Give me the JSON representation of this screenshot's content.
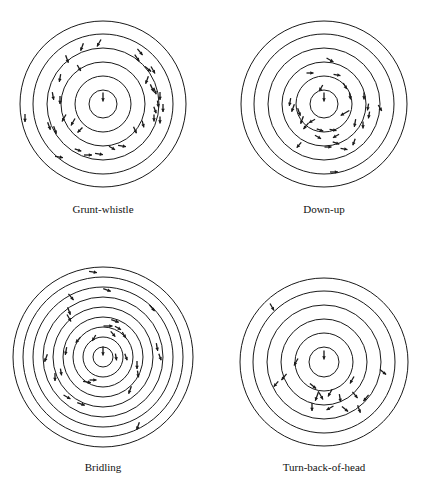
{
  "figure": {
    "panels": [
      {
        "id": "grunt-whistle",
        "caption": "Grunt-whistle",
        "center": [
          103,
          104
        ],
        "ring_radii": [
          14,
          28,
          42,
          56,
          70,
          83
        ],
        "caption_pos": [
          103,
          211
        ],
        "arrows": [
          [
            103,
            97,
            0,
            9
          ],
          [
            99,
            43,
            -30,
            8
          ],
          [
            82,
            47,
            -20,
            8
          ],
          [
            67,
            59,
            20,
            8
          ],
          [
            79,
            68,
            30,
            7
          ],
          [
            60,
            78,
            -10,
            8
          ],
          [
            53,
            96,
            10,
            8
          ],
          [
            60,
            100,
            0,
            8
          ],
          [
            25,
            118,
            0,
            8
          ],
          [
            140,
            52,
            40,
            8
          ],
          [
            137,
            58,
            35,
            8
          ],
          [
            148,
            69,
            50,
            8
          ],
          [
            153,
            70,
            30,
            8
          ],
          [
            147,
            80,
            -20,
            8
          ],
          [
            152,
            88,
            25,
            8
          ],
          [
            155,
            91,
            20,
            7
          ],
          [
            160,
            96,
            0,
            8
          ],
          [
            158,
            104,
            10,
            7
          ],
          [
            163,
            108,
            0,
            8
          ],
          [
            155,
            110,
            20,
            7
          ],
          [
            154,
            118,
            0,
            7
          ],
          [
            160,
            120,
            0,
            7
          ],
          [
            143,
            124,
            15,
            7
          ],
          [
            135,
            130,
            25,
            7
          ],
          [
            122,
            146,
            80,
            8
          ],
          [
            112,
            148,
            60,
            7
          ],
          [
            99,
            154,
            80,
            8
          ],
          [
            88,
            155,
            90,
            8
          ],
          [
            78,
            150,
            70,
            7
          ],
          [
            73,
            122,
            -30,
            8
          ],
          [
            64,
            118,
            -30,
            8
          ],
          [
            80,
            130,
            -45,
            7
          ],
          [
            49,
            126,
            20,
            8
          ],
          [
            55,
            130,
            20,
            8
          ],
          [
            59,
            157,
            80,
            8
          ]
        ]
      },
      {
        "id": "down-up",
        "caption": "Down-up",
        "center": [
          324,
          104
        ],
        "ring_radii": [
          14,
          28,
          42,
          56,
          70,
          83
        ],
        "caption_pos": [
          324,
          212
        ],
        "arrows": [
          [
            324,
            97,
            0,
            9
          ],
          [
            330,
            60,
            60,
            8
          ],
          [
            310,
            73,
            90,
            7
          ],
          [
            337,
            75,
            80,
            7
          ],
          [
            321,
            88,
            -30,
            7
          ],
          [
            345,
            86,
            30,
            7
          ],
          [
            350,
            96,
            10,
            7
          ],
          [
            364,
            96,
            0,
            7
          ],
          [
            368,
            107,
            -10,
            7
          ],
          [
            380,
            108,
            30,
            7
          ],
          [
            369,
            115,
            -10,
            7
          ],
          [
            363,
            125,
            0,
            7
          ],
          [
            355,
            123,
            -10,
            8
          ],
          [
            290,
            102,
            -10,
            8
          ],
          [
            293,
            108,
            -20,
            8
          ],
          [
            299,
            112,
            20,
            8
          ],
          [
            302,
            120,
            -20,
            8
          ],
          [
            306,
            126,
            -40,
            8
          ],
          [
            312,
            121,
            -60,
            7
          ],
          [
            320,
            130,
            70,
            7
          ],
          [
            318,
            137,
            60,
            7
          ],
          [
            333,
            130,
            80,
            7
          ],
          [
            336,
            143,
            70,
            7
          ],
          [
            344,
            149,
            80,
            7
          ],
          [
            328,
            147,
            90,
            7
          ],
          [
            336,
            136,
            -60,
            7
          ],
          [
            299,
            145,
            -40,
            7
          ],
          [
            354,
            142,
            -20,
            7
          ],
          [
            334,
            172,
            90,
            8
          ],
          [
            345,
            113,
            -60,
            10
          ]
        ]
      },
      {
        "id": "bridling",
        "caption": "Bridling",
        "center": [
          103,
          357
        ],
        "ring_radii": [
          10,
          20,
          30,
          40,
          50,
          60,
          70,
          80,
          90
        ],
        "caption_pos": [
          103,
          470
        ],
        "arrows": [
          [
            103,
            351,
            0,
            9
          ],
          [
            93,
            272,
            80,
            8
          ],
          [
            107,
            290,
            70,
            8
          ],
          [
            71,
            297,
            40,
            8
          ],
          [
            69,
            311,
            20,
            8
          ],
          [
            69,
            318,
            30,
            8
          ],
          [
            115,
            321,
            70,
            8
          ],
          [
            108,
            326,
            90,
            9
          ],
          [
            118,
            328,
            60,
            7
          ],
          [
            124,
            335,
            30,
            7
          ],
          [
            113,
            334,
            40,
            7
          ],
          [
            94,
            338,
            -30,
            7
          ],
          [
            78,
            340,
            -40,
            7
          ],
          [
            66,
            351,
            -10,
            8
          ],
          [
            46,
            358,
            -20,
            8
          ],
          [
            55,
            377,
            0,
            8
          ],
          [
            116,
            357,
            10,
            7
          ],
          [
            126,
            357,
            20,
            7
          ],
          [
            152,
            308,
            40,
            8
          ],
          [
            157,
            347,
            10,
            8
          ],
          [
            160,
            357,
            20,
            7
          ],
          [
            137,
            365,
            0,
            8
          ],
          [
            138,
            374,
            10,
            7
          ],
          [
            130,
            390,
            -20,
            8
          ],
          [
            87,
            382,
            80,
            8
          ],
          [
            93,
            380,
            90,
            7
          ],
          [
            67,
            397,
            60,
            8
          ],
          [
            81,
            404,
            70,
            8
          ],
          [
            138,
            426,
            -20,
            8
          ],
          [
            61,
            372,
            10,
            7
          ]
        ]
      },
      {
        "id": "turn-back-of-head",
        "caption": "Turn-back-of-head",
        "center": [
          324,
          362
        ],
        "ring_radii": [
          15,
          29,
          43,
          57,
          71,
          84
        ],
        "caption_pos": [
          324,
          470
        ],
        "arrows": [
          [
            324,
            355,
            0,
            9
          ],
          [
            272,
            307,
            30,
            8
          ],
          [
            296,
            362,
            -30,
            8
          ],
          [
            284,
            377,
            -40,
            8
          ],
          [
            276,
            384,
            -40,
            7
          ],
          [
            313,
            386,
            50,
            8
          ],
          [
            352,
            380,
            -30,
            8
          ],
          [
            383,
            372,
            50,
            8
          ],
          [
            317,
            396,
            -20,
            10
          ],
          [
            321,
            396,
            30,
            8
          ],
          [
            330,
            393,
            -30,
            8
          ],
          [
            340,
            398,
            10,
            8
          ],
          [
            355,
            395,
            40,
            8
          ],
          [
            366,
            398,
            -40,
            8
          ],
          [
            312,
            407,
            0,
            8
          ],
          [
            330,
            408,
            -60,
            8
          ],
          [
            345,
            409,
            50,
            8
          ],
          [
            359,
            409,
            20,
            8
          ]
        ]
      }
    ],
    "colors": {
      "ink": "#1a1a1a",
      "background": "#ffffff"
    }
  }
}
